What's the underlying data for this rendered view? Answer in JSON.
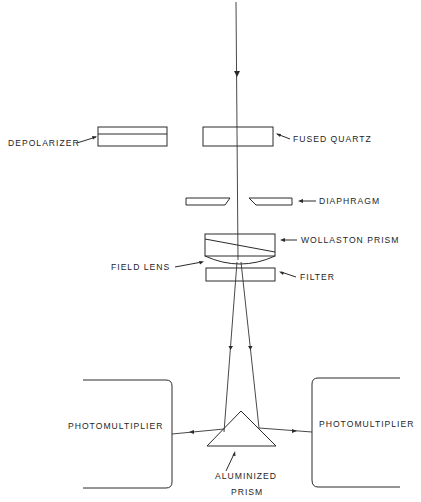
{
  "diagram": {
    "type": "optical-schematic",
    "components": [
      {
        "id": "depolarizer",
        "label": "DEPOLARIZER"
      },
      {
        "id": "fused-quartz",
        "label": "FUSED QUARTZ"
      },
      {
        "id": "diaphragm",
        "label": "DIAPHRAGM"
      },
      {
        "id": "wollaston-prism",
        "label": "WOLLASTON PRISM"
      },
      {
        "id": "field-lens",
        "label": "FIELD LENS"
      },
      {
        "id": "filter",
        "label": "FILTER"
      },
      {
        "id": "photomultiplier-left",
        "label": "PHOTOMULTIPLIER"
      },
      {
        "id": "photomultiplier-right",
        "label": "PHOTOMULTIPLIER"
      },
      {
        "id": "aluminized-prism",
        "label_line1": "ALUMINIZED",
        "label_line2": "PRISM"
      }
    ],
    "beam_path": [
      "incident beam",
      "fused-quartz",
      "diaphragm",
      "wollaston-prism",
      "field-lens",
      "filter",
      "aluminized-prism",
      "photomultiplier-left",
      "photomultiplier-right"
    ]
  }
}
